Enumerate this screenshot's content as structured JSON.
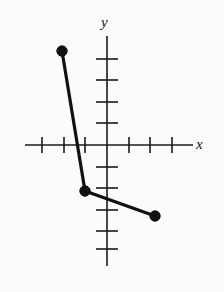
{
  "figure": {
    "background_color": "#fbfbfa",
    "ink_color": "#111111",
    "axis_color": "#1a1a1a",
    "y_axis_label": "y",
    "x_axis_label": "x"
  },
  "chart_data": {
    "type": "line",
    "title": "",
    "xlabel": "x",
    "ylabel": "y",
    "xlim": [
      -4,
      4
    ],
    "ylim": [
      -5,
      5
    ],
    "grid": false,
    "legend": null,
    "x_ticks": [
      -3,
      -2,
      -1,
      1,
      2,
      3
    ],
    "y_ticks": [
      -4,
      -3,
      -2,
      -1,
      1,
      2,
      3,
      4
    ],
    "tick_labels_shown": false,
    "axis_origin_px": [
      107,
      145
    ],
    "unit_px": 21.5,
    "series": [
      {
        "name": "piecewise-segment",
        "marker": "filled-circle",
        "endpoints_marked": true,
        "points": [
          {
            "x": -2.1,
            "y": 4.4
          },
          {
            "x": -1.0,
            "y": -2.1
          },
          {
            "x": 2.2,
            "y": -3.3
          }
        ]
      }
    ],
    "annotations": []
  },
  "geometry_px": {
    "x_axis": {
      "x1": 25,
      "y1": 145,
      "x2": 193,
      "y2": 145
    },
    "y_axis": {
      "x1": 107,
      "y1": 36,
      "x2": 107,
      "y2": 266
    },
    "x_tick_positions": [
      42,
      64,
      85,
      129,
      150,
      172
    ],
    "x_tick_half_len": 8,
    "y_tick_positions": [
      59,
      80,
      102,
      123,
      167,
      188,
      210,
      231,
      249
    ],
    "y_tick_half_len": 11,
    "data_points": [
      {
        "cx": 62,
        "cy": 51,
        "r": 5.2
      },
      {
        "cx": 85,
        "cy": 191,
        "r": 5.2
      },
      {
        "cx": 155,
        "cy": 216,
        "r": 5.2
      }
    ],
    "polyline": "62,51 85,191 155,216"
  }
}
